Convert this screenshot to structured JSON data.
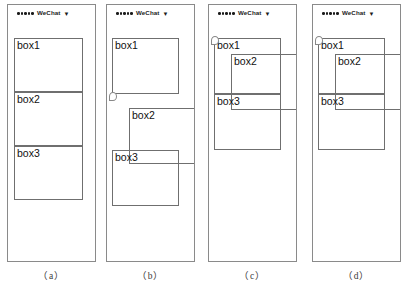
{
  "figure": {
    "width": 409,
    "height": 291,
    "background": "#ffffff",
    "border_color": "#8a8a8a",
    "box_border_color": "#6f6f6f",
    "text_color": "#111111"
  },
  "status_bar": {
    "signal_dots": 5,
    "carrier": "WeChat",
    "wifi_icon": "wifi-down-chevron-icon",
    "wifi_glyph": "▼"
  },
  "panels": [
    {
      "caption": "（a）",
      "id": "panel-a",
      "cursor": null,
      "boxes": [
        {
          "label": "box1",
          "x": 6,
          "y": 16,
          "w": 69,
          "h": 54
        },
        {
          "label": "box2",
          "x": 6,
          "y": 70,
          "w": 69,
          "h": 54
        },
        {
          "label": "box3",
          "x": 6,
          "y": 124,
          "w": 69,
          "h": 54
        }
      ]
    },
    {
      "caption": "（b）",
      "id": "panel-b",
      "cursor": {
        "x": 2,
        "y": 70
      },
      "boxes": [
        {
          "label": "box1",
          "x": 5,
          "y": 16,
          "w": 67,
          "h": 56
        },
        {
          "label": "box2",
          "x": 22,
          "y": 86,
          "w": 67,
          "h": 56
        },
        {
          "label": "box3",
          "x": 5,
          "y": 128,
          "w": 67,
          "h": 56
        }
      ]
    },
    {
      "caption": "（c）",
      "id": "panel-c",
      "cursor": {
        "x": 2,
        "y": 14
      },
      "boxes": [
        {
          "label": "box1",
          "x": 5,
          "y": 16,
          "w": 67,
          "h": 56
        },
        {
          "label": "box2",
          "x": 22,
          "y": 32,
          "w": 67,
          "h": 56
        },
        {
          "label": "box3",
          "x": 5,
          "y": 72,
          "w": 67,
          "h": 56
        }
      ]
    },
    {
      "caption": "（d）",
      "id": "panel-d",
      "cursor": {
        "x": 2,
        "y": 14
      },
      "boxes": [
        {
          "label": "box1",
          "x": 5,
          "y": 16,
          "w": 67,
          "h": 56
        },
        {
          "label": "box2",
          "x": 22,
          "y": 32,
          "w": 67,
          "h": 56
        },
        {
          "label": "box3",
          "x": 5,
          "y": 72,
          "w": 67,
          "h": 56
        }
      ]
    }
  ]
}
